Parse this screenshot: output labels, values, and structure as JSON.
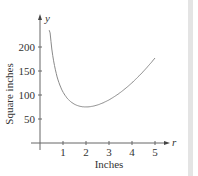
{
  "chart_data": {
    "type": "line",
    "title": "",
    "xlabel": "Inches",
    "ylabel": "Square inches",
    "x_axis_var": "r",
    "y_axis_var": "y",
    "x_ticks": [
      1,
      2,
      3,
      4,
      5
    ],
    "y_ticks": [
      50,
      100,
      150,
      200
    ],
    "xlim": [
      0,
      5.4
    ],
    "ylim": [
      0,
      240
    ],
    "grid": false,
    "series": [
      {
        "name": "y",
        "x": [
          0.4,
          0.5,
          0.75,
          1,
          1.25,
          1.5,
          1.75,
          2,
          2.5,
          3,
          3.5,
          4,
          4.5,
          5
        ],
        "values": [
          235,
          202,
          137,
          106,
          90,
          81,
          77,
          75,
          79,
          90,
          106,
          125,
          149,
          177
        ]
      }
    ],
    "line_color": "#8a8a8a",
    "axis_color": "#555555"
  }
}
